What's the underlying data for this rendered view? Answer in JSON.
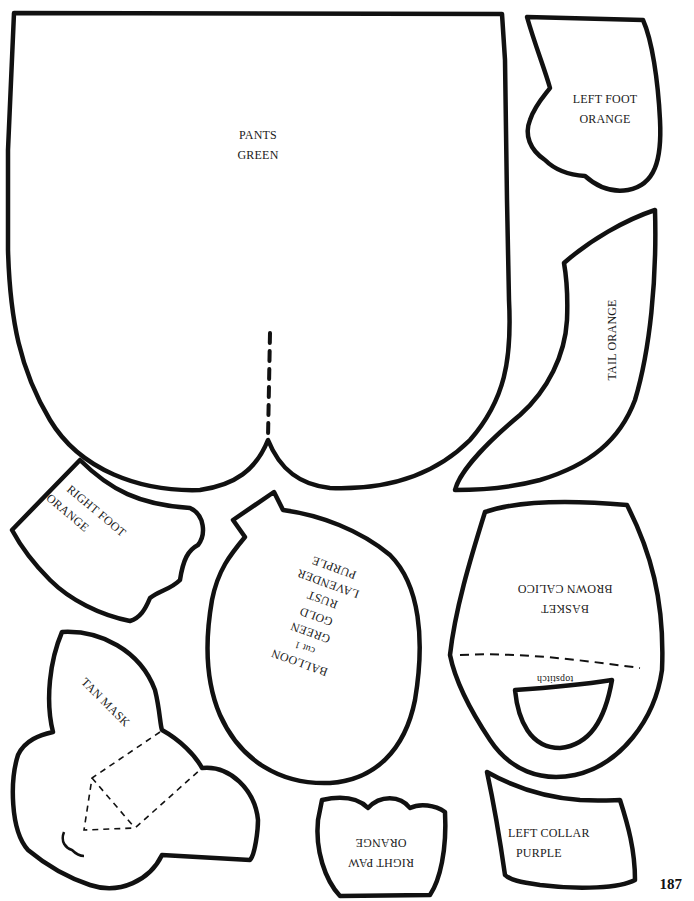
{
  "page": {
    "number": "187"
  },
  "pieces": {
    "pants": {
      "name": "PANTS",
      "color": "GREEN"
    },
    "left_foot": {
      "name": "LEFT FOOT",
      "color": "ORANGE"
    },
    "tail": {
      "name": "TAIL ORANGE"
    },
    "right_foot": {
      "name": "RIGHT FOOT",
      "color": "ORANGE"
    },
    "balloon": {
      "name": "BALLOON",
      "cut": "cut 1",
      "colors": [
        "GREEN",
        "GOLD",
        "RUST",
        "LAVENDER",
        "PURPLE"
      ]
    },
    "basket": {
      "name": "BASKET",
      "color": "BROWN CALICO",
      "note": "topstitch"
    },
    "tan_mask": {
      "name": "TAN MASK"
    },
    "right_paw": {
      "name": "RIGHT PAW",
      "color": "ORANGE"
    },
    "left_collar": {
      "name": "LEFT COLLAR",
      "color": "PURPLE"
    }
  }
}
